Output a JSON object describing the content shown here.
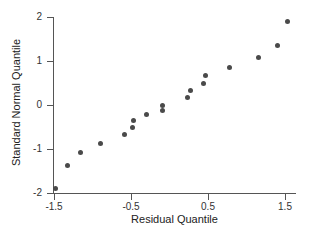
{
  "chart_data": {
    "type": "scatter",
    "title": "",
    "subtitle": "",
    "xlabel": "Residual Quantile",
    "ylabel": "Standard Normal Quantile",
    "xlim": [
      -1.5,
      1.65
    ],
    "ylim": [
      -2,
      2
    ],
    "grid": false,
    "legend": null,
    "legend_position": "none",
    "x_ticks": [
      -1.5,
      -0.5,
      0.5,
      1.5
    ],
    "x_tick_labels": [
      "-1.5",
      "-0.5",
      "0.5",
      "1.5"
    ],
    "y_ticks": [
      2,
      1,
      0,
      -1,
      -2
    ],
    "y_tick_labels": [
      "2",
      "1",
      "0",
      "-1",
      "-2"
    ],
    "marker_color": "#4a4a4a",
    "marker_size": 5,
    "axis_color": "#555555",
    "background_color": "#ffffff",
    "n_points": 18,
    "x": [
      -1.48,
      -1.32,
      -1.15,
      -0.9,
      -0.58,
      -0.48,
      -0.47,
      -0.3,
      -0.09,
      -0.09,
      0.23,
      0.27,
      0.44,
      0.47,
      0.78,
      1.15,
      1.4,
      1.53
    ],
    "y": [
      -1.9,
      -1.38,
      -1.09,
      -0.87,
      -0.68,
      -0.51,
      -0.36,
      -0.22,
      -0.13,
      0.0,
      0.17,
      0.34,
      0.5,
      0.66,
      0.86,
      1.08,
      1.36,
      1.89
    ],
    "points": [
      {
        "x": -1.48,
        "y": -1.9
      },
      {
        "x": -1.32,
        "y": -1.38
      },
      {
        "x": -1.15,
        "y": -1.09
      },
      {
        "x": -0.9,
        "y": -0.87
      },
      {
        "x": -0.58,
        "y": -0.68
      },
      {
        "x": -0.48,
        "y": -0.51
      },
      {
        "x": -0.47,
        "y": -0.36
      },
      {
        "x": -0.3,
        "y": -0.22
      },
      {
        "x": -0.09,
        "y": -0.13
      },
      {
        "x": -0.09,
        "y": 0.0
      },
      {
        "x": 0.23,
        "y": 0.17
      },
      {
        "x": 0.27,
        "y": 0.34
      },
      {
        "x": 0.44,
        "y": 0.5
      },
      {
        "x": 0.47,
        "y": 0.66
      },
      {
        "x": 0.78,
        "y": 0.86
      },
      {
        "x": 1.15,
        "y": 1.08
      },
      {
        "x": 1.4,
        "y": 1.36
      },
      {
        "x": 1.53,
        "y": 1.89
      }
    ]
  }
}
